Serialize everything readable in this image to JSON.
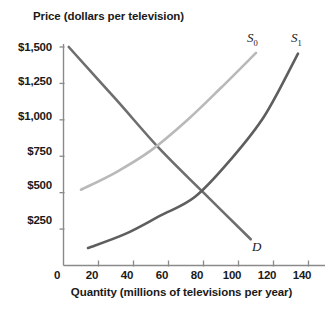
{
  "chart_data": {
    "type": "line",
    "title": "",
    "xlabel": "Quantity (millions of televisions per year)",
    "ylabel": "Price (dollars per television)",
    "xlim": [
      0,
      145
    ],
    "ylim": [
      0,
      1600
    ],
    "grid": false,
    "legend": "inline-curve-labels",
    "xticks": [
      0,
      20,
      40,
      60,
      80,
      100,
      120,
      140
    ],
    "xtick_labels": [
      "0",
      "20",
      "40",
      "60",
      "80",
      "100",
      "120",
      "140"
    ],
    "yticks": [
      250,
      500,
      750,
      1000,
      1250,
      1500
    ],
    "ytick_labels": [
      "$250",
      "$500",
      "$750",
      "$1,000",
      "$1,250",
      "$1,500"
    ],
    "series": [
      {
        "name": "D",
        "label": "D",
        "color": "#6e6e6e",
        "description": "Demand curve, downward sloping straight line",
        "points": [
          [
            3,
            1500
          ],
          [
            30,
            1140
          ],
          [
            55,
            800
          ],
          [
            80,
            500
          ],
          [
            107,
            180
          ]
        ]
      },
      {
        "name": "S0",
        "label": "S",
        "sublabel": "0",
        "color": "#b9b9b9",
        "description": "Original supply curve, upward sloping convex",
        "points": [
          [
            10,
            520
          ],
          [
            30,
            640
          ],
          [
            50,
            790
          ],
          [
            70,
            990
          ],
          [
            90,
            1220
          ],
          [
            110,
            1460
          ]
        ]
      },
      {
        "name": "S1",
        "label": "S",
        "sublabel": "1",
        "color": "#5e5e5e",
        "description": "New supply curve shifted right, upward sloping convex",
        "points": [
          [
            14,
            120
          ],
          [
            35,
            215
          ],
          [
            55,
            340
          ],
          [
            75,
            470
          ],
          [
            95,
            720
          ],
          [
            115,
            1030
          ],
          [
            134,
            1455
          ]
        ]
      }
    ],
    "annotations": [
      {
        "text": "S",
        "sub": "0",
        "x": 110,
        "y": 1590
      },
      {
        "text": "S",
        "sub": "1",
        "x": 134,
        "y": 1600
      },
      {
        "text": "D",
        "x": 112,
        "y": 230
      }
    ],
    "equilibrium": {
      "quantity": 80,
      "price": 500
    }
  },
  "axes": {
    "y_title": "Price (dollars per television)",
    "x_title": "Quantity (millions of televisions per year)",
    "y_ticks": [
      "$1,500",
      "$1,250",
      "$1,000",
      "$750",
      "$500",
      "$250"
    ],
    "x_ticks": [
      "0",
      "20",
      "40",
      "60",
      "80",
      "100",
      "120",
      "140"
    ]
  },
  "labels": {
    "supply0": "S",
    "supply0_sub": "0",
    "supply1": "S",
    "supply1_sub": "1",
    "demand": "D"
  },
  "colors": {
    "demand": "#6e6e6e",
    "supply0": "#b9b9b9",
    "supply1": "#5e5e5e",
    "axis": "#8a8a8a",
    "text": "#1a1a1a",
    "background": "#ffffff"
  }
}
